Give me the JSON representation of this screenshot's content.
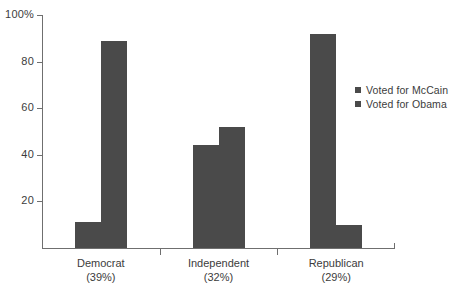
{
  "chart_data": {
    "type": "bar",
    "title": "",
    "xlabel": "",
    "ylabel": "",
    "ylim": [
      0,
      100
    ],
    "grid": false,
    "legend_position": "right",
    "categories": [
      "Democrat",
      "Independent",
      "Republican"
    ],
    "category_shares": [
      "(39%)",
      "(32%)",
      "(29%)"
    ],
    "series": [
      {
        "name": "Voted for McCain",
        "color": "#4a4a4a",
        "values": [
          11,
          44,
          92
        ]
      },
      {
        "name": "Voted for Obama",
        "color": "#4a4a4a",
        "values": [
          89,
          52,
          10
        ]
      }
    ],
    "yticks": [
      {
        "value": 100,
        "label": "100%"
      },
      {
        "value": 80,
        "label": "80"
      },
      {
        "value": 60,
        "label": "60"
      },
      {
        "value": 40,
        "label": "40"
      },
      {
        "value": 20,
        "label": "20"
      }
    ]
  },
  "legend": {
    "items": [
      {
        "label": "Voted for McCain"
      },
      {
        "label": "Voted for Obama"
      }
    ]
  },
  "axis": {
    "y_labels": [
      "100%",
      "80",
      "60",
      "40",
      "20"
    ],
    "x_labels": [
      "Democrat",
      "Independent",
      "Republican"
    ],
    "x_sublabels": [
      "(39%)",
      "(32%)",
      "(29%)"
    ]
  },
  "colors": {
    "bar": "#4a4a4a",
    "axis": "#6f6f6f",
    "text": "#3c3c3c",
    "background": "#ffffff"
  }
}
